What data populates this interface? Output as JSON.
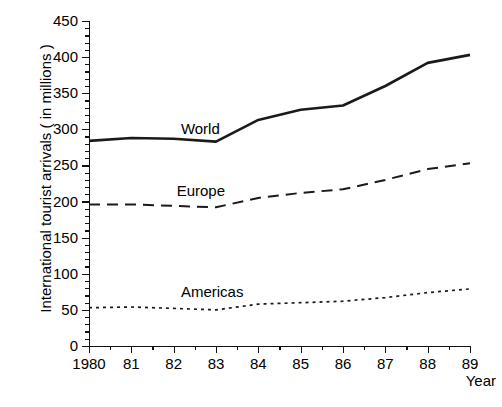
{
  "chart_data": {
    "type": "line",
    "title": "",
    "xlabel": "Year",
    "ylabel": "International tourist arrivals ( in millions )",
    "x": [
      1980,
      1981,
      1982,
      1983,
      1984,
      1985,
      1986,
      1987,
      1988,
      1989
    ],
    "xtick_labels": [
      "1980",
      "81",
      "82",
      "83",
      "84",
      "85",
      "86",
      "87",
      "88",
      "89"
    ],
    "ytick_labels": [
      "0",
      "50",
      "100",
      "150",
      "200",
      "250",
      "300",
      "350",
      "400",
      "450"
    ],
    "ytick_values": [
      0,
      50,
      100,
      150,
      200,
      250,
      300,
      350,
      400,
      450
    ],
    "yminor_step": 10,
    "ylim": [
      0,
      450
    ],
    "xlim": [
      1980,
      1989
    ],
    "grid": false,
    "legend_position": "inline-annotation",
    "series": [
      {
        "name": "World",
        "style": "solid",
        "color": "#1a1a1a",
        "label_x": 1982.1,
        "label_y": 300,
        "values": [
          284,
          288,
          287,
          283,
          313,
          327,
          333,
          360,
          392,
          403
        ]
      },
      {
        "name": "Europe",
        "style": "dashed",
        "color": "#1a1a1a",
        "label_x": 1982.0,
        "label_y": 215,
        "values": [
          196,
          196,
          194,
          192,
          205,
          212,
          217,
          230,
          245,
          253
        ]
      },
      {
        "name": "Americas",
        "style": "dotted",
        "color": "#1a1a1a",
        "label_x": 1982.1,
        "label_y": 75,
        "values": [
          53,
          54,
          52,
          50,
          58,
          60,
          62,
          67,
          74,
          79
        ]
      }
    ]
  },
  "axis": {
    "y_title": "International tourist arrivals ( in millions )",
    "x_title": "Year"
  }
}
